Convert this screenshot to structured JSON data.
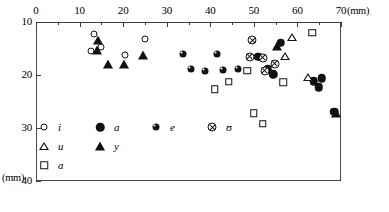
{
  "chart_data": {
    "type": "scatter",
    "title": "",
    "xlabel": "(mm)",
    "ylabel": "(mm)",
    "xlim": [
      0,
      70
    ],
    "ylim": [
      10,
      40
    ],
    "y_inverted": true,
    "grid": false,
    "x_ticks": [
      0,
      10,
      20,
      30,
      40,
      50,
      60,
      70
    ],
    "x_tick_labels": [
      "0",
      "10",
      "20",
      "30",
      "40",
      "50",
      "60",
      "70"
    ],
    "x_minor_ticks": [
      5,
      15,
      25,
      35,
      45,
      55,
      65
    ],
    "y_ticks": [
      10,
      20,
      30,
      40
    ],
    "y_tick_labels": [
      "10",
      "20",
      "30",
      "40"
    ],
    "x_unit_label": "(mm)",
    "y_unit_label": "(mm)",
    "legend_position": "inside-lower-left",
    "series": [
      {
        "name": "i",
        "key": "i",
        "marker": "open-circle",
        "points": [
          [
            13.3,
            12.3
          ],
          [
            12.6,
            15.4
          ],
          [
            14.9,
            14.8
          ],
          [
            20.4,
            16.2
          ],
          [
            25.0,
            13.3
          ]
        ]
      },
      {
        "name": "a",
        "key": "a",
        "marker": "filled-circle",
        "points": [
          [
            51.0,
            16.6
          ],
          [
            53.2,
            18.9
          ],
          [
            54.5,
            19.9
          ],
          [
            56.2,
            13.9
          ],
          [
            63.8,
            21.2
          ],
          [
            64.9,
            22.3
          ],
          [
            65.6,
            20.6
          ],
          [
            68.5,
            26.9
          ]
        ]
      },
      {
        "name": "e",
        "key": "e",
        "marker": "filled-circle-small",
        "points": [
          [
            33.8,
            16.1
          ],
          [
            35.5,
            18.8
          ],
          [
            38.8,
            19.3
          ],
          [
            41.5,
            16.0
          ],
          [
            43.0,
            19.0
          ],
          [
            46.4,
            18.9
          ]
        ]
      },
      {
        "name": "ʊ",
        "key": "U",
        "marker": "circled-x",
        "points": [
          [
            49.6,
            13.4
          ],
          [
            49.0,
            16.6
          ],
          [
            52.0,
            16.7
          ],
          [
            52.5,
            19.2
          ],
          [
            54.8,
            17.9
          ]
        ]
      },
      {
        "name": "u",
        "key": "u",
        "marker": "open-triangle",
        "points": [
          [
            58.8,
            12.8
          ],
          [
            57.1,
            16.4
          ],
          [
            62.5,
            20.3
          ]
        ]
      },
      {
        "name": "y",
        "key": "y",
        "marker": "filled-triangle",
        "points": [
          [
            14.3,
            13.4
          ],
          [
            14.0,
            15.3
          ],
          [
            16.5,
            17.9
          ],
          [
            20.3,
            18.0
          ],
          [
            24.6,
            16.3
          ],
          [
            55.4,
            14.5
          ],
          [
            68.9,
            27.2
          ]
        ]
      },
      {
        "name": "ɑ",
        "key": "A",
        "marker": "open-square",
        "points": [
          [
            41.0,
            22.7
          ],
          [
            44.2,
            21.3
          ],
          [
            48.5,
            19.2
          ],
          [
            50.0,
            27.2
          ],
          [
            52.0,
            29.2
          ],
          [
            56.8,
            21.4
          ],
          [
            63.4,
            12.0
          ]
        ]
      }
    ],
    "legend_rows": [
      [
        {
          "key": "i",
          "label": "i"
        },
        {
          "key": "a",
          "label": "a"
        },
        {
          "key": "e",
          "label": "e"
        },
        {
          "key": "U",
          "label": "ʊ"
        }
      ],
      [
        {
          "key": "u",
          "label": "u"
        },
        {
          "key": "y",
          "label": "y"
        }
      ],
      [
        {
          "key": "A",
          "label": "ɑ"
        }
      ]
    ]
  }
}
